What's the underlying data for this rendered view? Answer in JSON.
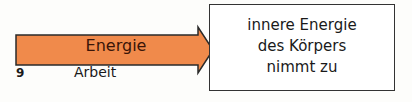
{
  "figure": {
    "number": "9",
    "arrow": {
      "label": "Energie",
      "sublabel": "Arbeit",
      "color": "#f08a4b"
    },
    "box": {
      "lines": [
        "innere Energie",
        "des Körpers",
        "nimmt zu"
      ]
    }
  }
}
